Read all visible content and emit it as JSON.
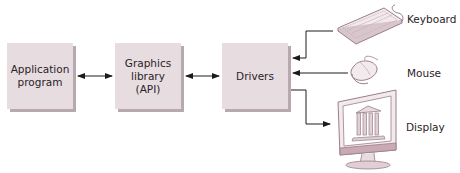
{
  "diagram": {
    "boxes": [
      {
        "id": "app",
        "line1": "Application",
        "line2": "program",
        "line3": ""
      },
      {
        "id": "gfx",
        "line1": "Graphics",
        "line2": "library",
        "line3": "(API)"
      },
      {
        "id": "drv",
        "line1": "Drivers",
        "line2": "",
        "line3": ""
      }
    ],
    "devices": [
      {
        "id": "keyboard",
        "label": "Keyboard",
        "icon": "keyboard-icon"
      },
      {
        "id": "mouse",
        "label": "Mouse",
        "icon": "mouse-icon"
      },
      {
        "id": "display",
        "label": "Display",
        "icon": "monitor-icon"
      }
    ],
    "connections": [
      {
        "from": "app",
        "to": "gfx",
        "type": "bidirectional"
      },
      {
        "from": "gfx",
        "to": "drv",
        "type": "bidirectional"
      },
      {
        "from": "keyboard",
        "to": "drv",
        "type": "input"
      },
      {
        "from": "mouse",
        "to": "drv",
        "type": "input"
      },
      {
        "from": "drv",
        "to": "display",
        "type": "output"
      }
    ],
    "colors": {
      "box_fill": "#e7dde1",
      "box_shadow": "#b8a9af",
      "line": "#1e1a1c",
      "device_stroke": "#9a7f88",
      "device_fill": "#f3eaed"
    }
  }
}
